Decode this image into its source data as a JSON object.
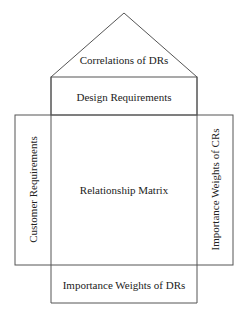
{
  "diagram": {
    "roof": {
      "label": "Correlations of DRs"
    },
    "design_requirements": {
      "label": "Design Requirements"
    },
    "customer_requirements": {
      "label": "Customer Requirements"
    },
    "relationship_matrix": {
      "label": "Relationship Matrix"
    },
    "importance_weights_crs": {
      "label": "Importance Weights of CRs"
    },
    "importance_weights_drs": {
      "label": "Importance Weights of DRs"
    }
  },
  "colors": {
    "line": "#555555",
    "text": "#222222",
    "background": "#ffffff"
  }
}
